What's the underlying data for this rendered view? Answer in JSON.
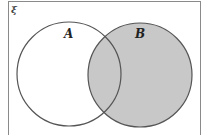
{
  "diagram": {
    "type": "venn",
    "universal_label": "ξ",
    "sets": [
      {
        "label": "A",
        "shaded": false
      },
      {
        "label": "B",
        "shaded": true
      }
    ],
    "shaded_region": "B",
    "colors": {
      "shade": "#c8c8c8",
      "stroke": "#555555",
      "frame": "#888888"
    }
  }
}
